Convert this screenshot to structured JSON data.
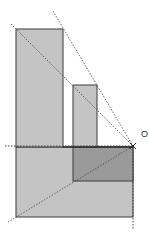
{
  "diagram": {
    "type": "perspective-projection",
    "point_label": "O",
    "colors": {
      "light_fill": "#c4c4c4",
      "dark_fill": "#9a9a9a",
      "stroke": "#3a3a3a",
      "dotted": "#444444",
      "background": "#ffffff"
    },
    "shapes": [
      {
        "name": "tall-rectangle",
        "x": 16,
        "y": 29,
        "w": 47,
        "h": 118
      },
      {
        "name": "small-rectangle",
        "x": 73,
        "y": 85,
        "w": 24,
        "h": 62
      },
      {
        "name": "bottom-base",
        "x": 16,
        "y": 147,
        "w": 117,
        "h": 70
      },
      {
        "name": "dark-rectangle",
        "x": 73,
        "y": 147,
        "w": 60,
        "h": 34
      }
    ],
    "point_O": {
      "x": 133,
      "y": 146
    }
  }
}
